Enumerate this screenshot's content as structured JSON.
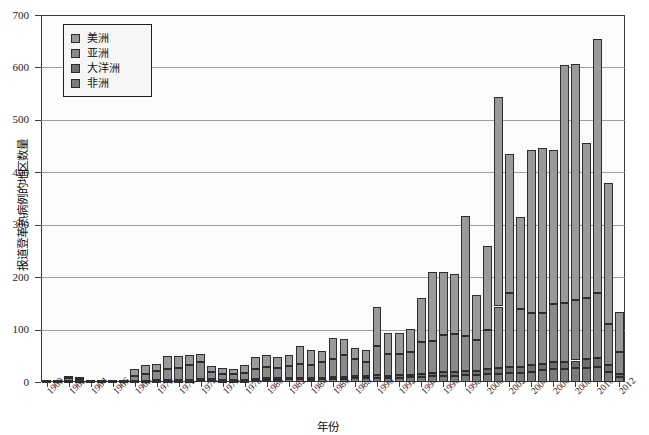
{
  "chart_data": {
    "type": "bar",
    "subtype": "stacked-bar",
    "title": "",
    "xlabel": "年份",
    "ylabel": "报道登革热病例的地区数量",
    "ylim": [
      0,
      700
    ],
    "ytick_labels": [
      "0",
      "100",
      "200",
      "300",
      "400",
      "500",
      "600",
      "700"
    ],
    "ytick_values": [
      0,
      100,
      200,
      300,
      400,
      500,
      600,
      700
    ],
    "grid": true,
    "grid_axis": "y",
    "legend_position": "upper-left",
    "xlim": [
      1959.5,
      2012.5
    ],
    "xtick_labels": [
      "1960",
      "1962",
      "1964",
      "1966",
      "1968",
      "1970",
      "1972",
      "1974",
      "1976",
      "1978",
      "1980",
      "1982",
      "1984",
      "1986",
      "1988",
      "1990",
      "1992",
      "1994",
      "1996",
      "1998",
      "2000",
      "2002",
      "2004",
      "2006",
      "2008",
      "2010",
      "2012"
    ],
    "xtick_values": [
      1960,
      1962,
      1964,
      1966,
      1968,
      1970,
      1972,
      1974,
      1976,
      1978,
      1980,
      1982,
      1984,
      1986,
      1988,
      1990,
      1992,
      1994,
      1996,
      1998,
      2000,
      2002,
      2004,
      2006,
      2008,
      2010,
      2012
    ],
    "xtick_rotation": -45,
    "categories": [
      1960,
      1961,
      1962,
      1963,
      1964,
      1965,
      1966,
      1967,
      1968,
      1969,
      1970,
      1971,
      1972,
      1973,
      1974,
      1975,
      1976,
      1977,
      1978,
      1979,
      1980,
      1981,
      1982,
      1983,
      1984,
      1985,
      1986,
      1987,
      1988,
      1989,
      1990,
      1991,
      1992,
      1993,
      1994,
      1995,
      1996,
      1997,
      1998,
      1999,
      2000,
      2001,
      2002,
      2003,
      2004,
      2005,
      2006,
      2007,
      2008,
      2009,
      2010,
      2011,
      2012
    ],
    "series": [
      {
        "name": "非洲",
        "color": "#7b7b7b",
        "values": [
          0,
          0,
          1,
          1,
          0,
          0,
          0,
          0,
          1,
          1,
          2,
          2,
          2,
          2,
          3,
          3,
          2,
          2,
          2,
          3,
          4,
          4,
          5,
          5,
          4,
          5,
          6,
          6,
          7,
          7,
          8,
          7,
          8,
          9,
          10,
          11,
          12,
          12,
          13,
          13,
          15,
          16,
          18,
          18,
          20,
          22,
          24,
          24,
          26,
          27,
          28,
          20,
          10
        ]
      },
      {
        "name": "大洋洲",
        "color": "#6f6f6f",
        "values": [
          0,
          0,
          1,
          1,
          0,
          0,
          0,
          0,
          1,
          1,
          2,
          2,
          2,
          2,
          3,
          2,
          2,
          2,
          2,
          2,
          3,
          3,
          3,
          3,
          3,
          3,
          4,
          4,
          4,
          4,
          5,
          4,
          5,
          5,
          6,
          6,
          7,
          7,
          8,
          8,
          9,
          10,
          11,
          11,
          12,
          13,
          14,
          14,
          15,
          16,
          17,
          12,
          6
        ]
      },
      {
        "name": "亚洲",
        "color": "#8a8a8a",
        "values": [
          1,
          1,
          5,
          4,
          2,
          2,
          2,
          2,
          10,
          14,
          17,
          21,
          22,
          28,
          32,
          14,
          12,
          11,
          14,
          20,
          22,
          20,
          22,
          26,
          26,
          30,
          34,
          42,
          32,
          28,
          55,
          42,
          40,
          44,
          60,
          62,
          70,
          72,
          66,
          60,
          75,
          118,
          140,
          110,
          100,
          96,
          110,
          112,
          115,
          118,
          125,
          78,
          42
        ]
      },
      {
        "name": "美洲",
        "color": "#9a9a9a",
        "values": [
          2,
          2,
          5,
          4,
          2,
          2,
          2,
          2,
          12,
          16,
          14,
          24,
          24,
          20,
          16,
          12,
          10,
          10,
          14,
          22,
          22,
          20,
          22,
          34,
          28,
          22,
          40,
          30,
          22,
          22,
          75,
          40,
          40,
          44,
          84,
          130,
          120,
          115,
          230,
          84,
          160,
          400,
          265,
          175,
          310,
          315,
          295,
          455,
          450,
          295,
          485,
          270,
          75
        ]
      }
    ],
    "totals": [
      3,
      3,
      12,
      10,
      4,
      4,
      4,
      4,
      24,
      32,
      35,
      49,
      50,
      52,
      54,
      31,
      26,
      25,
      32,
      47,
      51,
      47,
      52,
      68,
      61,
      60,
      84,
      82,
      65,
      61,
      143,
      93,
      93,
      102,
      160,
      209,
      209,
      206,
      317,
      165,
      259,
      544,
      434,
      314,
      442,
      446,
      443,
      605,
      606,
      456,
      655,
      380,
      133
    ]
  },
  "legend": {
    "items": [
      {
        "label": "美洲"
      },
      {
        "label": "亚洲"
      },
      {
        "label": "大洋洲"
      },
      {
        "label": "非洲"
      }
    ]
  }
}
